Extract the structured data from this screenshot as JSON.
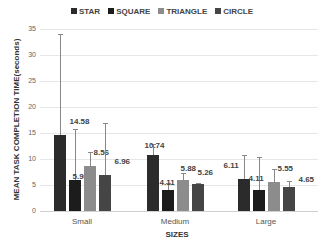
{
  "chart_data": {
    "type": "bar",
    "title": "",
    "xlabel": "SIZES",
    "ylabel": "MEAN TASK COMPLETION TIME(seconds)",
    "ylim": [
      0,
      35
    ],
    "yticks": [
      0,
      5,
      10,
      15,
      20,
      25,
      30,
      35
    ],
    "grid": true,
    "legend_position": "top",
    "categories": [
      "Small",
      "Medium",
      "Large"
    ],
    "series": [
      {
        "name": "STAR",
        "color": "#2b2b2b",
        "values": [
          14.58,
          10.74,
          6.11
        ],
        "error_top": [
          34.0,
          12.8,
          10.7
        ]
      },
      {
        "name": "SQUARE",
        "color": "#1c1c1c",
        "values": [
          5.95,
          4.11,
          4.11
        ],
        "error_top": [
          15.8,
          5.3,
          10.4
        ]
      },
      {
        "name": "TRIANGLE",
        "color": "#8c8c8c",
        "values": [
          8.56,
          5.88,
          5.55
        ],
        "error_top": [
          11.3,
          7.3,
          8.1
        ]
      },
      {
        "name": "CIRCLE",
        "color": "#454545",
        "values": [
          6.96,
          5.26,
          4.65
        ],
        "error_top": [
          16.9,
          5.3,
          5.8
        ]
      }
    ],
    "data_labels": [
      [
        "14.58",
        "5.95",
        "8.56",
        "6.96"
      ],
      [
        "10.74",
        "4.11",
        "5.88",
        "5.26"
      ],
      [
        "6.11",
        "4.11",
        "5.55",
        "4.65"
      ]
    ]
  }
}
